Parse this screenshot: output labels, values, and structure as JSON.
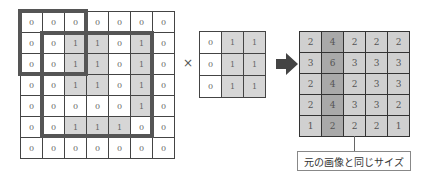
{
  "input": {
    "rows": [
      [
        0,
        0,
        0,
        0,
        0,
        0,
        0
      ],
      [
        0,
        0,
        1,
        1,
        0,
        1,
        0
      ],
      [
        0,
        0,
        1,
        1,
        0,
        1,
        0
      ],
      [
        0,
        0,
        1,
        1,
        0,
        1,
        0
      ],
      [
        0,
        0,
        0,
        0,
        0,
        1,
        0
      ],
      [
        0,
        0,
        1,
        1,
        1,
        0,
        0
      ],
      [
        0,
        0,
        0,
        0,
        0,
        0,
        0
      ]
    ]
  },
  "operator": "×",
  "kernel": {
    "rows": [
      [
        0,
        1,
        1
      ],
      [
        0,
        1,
        1
      ],
      [
        0,
        1,
        1
      ]
    ]
  },
  "output": {
    "rows": [
      [
        2,
        4,
        2,
        2,
        2
      ],
      [
        3,
        6,
        3,
        3,
        3
      ],
      [
        2,
        4,
        2,
        3,
        3
      ],
      [
        2,
        4,
        3,
        3,
        2
      ],
      [
        1,
        2,
        2,
        2,
        1
      ]
    ],
    "dark_column": 1
  },
  "label": "元の画像と同じサイズ",
  "colors": {
    "frame": "#555555",
    "highlight": "#d6d6d6",
    "output_cell": "#d0d0d0",
    "output_dark": "#a9a9a9",
    "arrow": "#444444"
  }
}
